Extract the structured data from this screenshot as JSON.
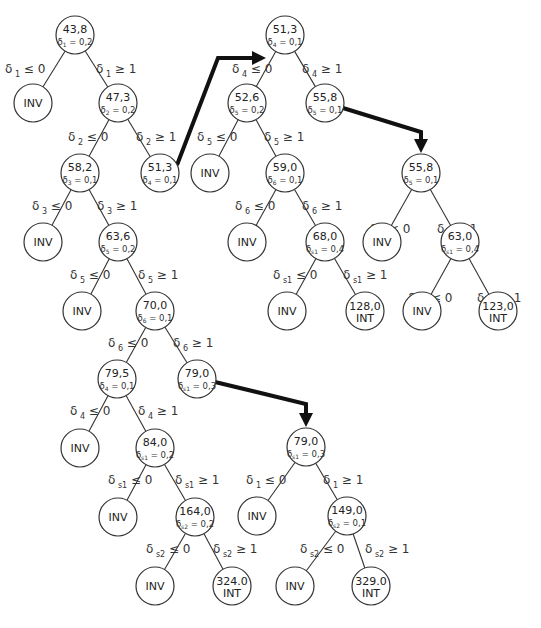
{
  "diagram": {
    "type": "branch-and-bound tree",
    "nodes": [
      {
        "id": "n1",
        "x": 75,
        "y": 35,
        "value": "43,8",
        "var": "1",
        "frac": "0,2"
      },
      {
        "id": "n2",
        "x": 33,
        "y": 103,
        "value": "INV"
      },
      {
        "id": "n3",
        "x": 118,
        "y": 103,
        "value": "47,3",
        "var": "2",
        "frac": "0,2"
      },
      {
        "id": "n4",
        "x": 80,
        "y": 173,
        "value": "58,2",
        "var": "3",
        "frac": "0,1"
      },
      {
        "id": "n5",
        "x": 160,
        "y": 173,
        "value": "51,3",
        "var": "4",
        "frac": "0,1"
      },
      {
        "id": "n6",
        "x": 43,
        "y": 242,
        "value": "INV"
      },
      {
        "id": "n7",
        "x": 118,
        "y": 242,
        "value": "63,6",
        "var": "5",
        "frac": "0,2"
      },
      {
        "id": "n8",
        "x": 82,
        "y": 311,
        "value": "INV"
      },
      {
        "id": "n9",
        "x": 155,
        "y": 311,
        "value": "70,0",
        "var": "6",
        "frac": "0,1"
      },
      {
        "id": "n10",
        "x": 117,
        "y": 379,
        "value": "79,5",
        "var": "4",
        "frac": "0,1"
      },
      {
        "id": "n11",
        "x": 197,
        "y": 379,
        "value": "79,0",
        "var": "s1",
        "frac": "0,3"
      },
      {
        "id": "n12",
        "x": 80,
        "y": 448,
        "value": "INV"
      },
      {
        "id": "n13",
        "x": 155,
        "y": 448,
        "value": "84,0",
        "var": "s1",
        "frac": "0,2"
      },
      {
        "id": "n14",
        "x": 118,
        "y": 517,
        "value": "INV"
      },
      {
        "id": "n15",
        "x": 195,
        "y": 517,
        "value": "164,0",
        "var": "s2",
        "frac": "0,2"
      },
      {
        "id": "n16",
        "x": 155,
        "y": 586,
        "value": "INV"
      },
      {
        "id": "n17",
        "x": 232,
        "y": 586,
        "value": "324.0",
        "tag": "INT"
      },
      {
        "id": "m1",
        "x": 285,
        "y": 35,
        "value": "51,3",
        "var": "4",
        "frac": "0,1"
      },
      {
        "id": "m2",
        "x": 247,
        "y": 103,
        "value": "52,6",
        "var": "5",
        "frac": "0,2"
      },
      {
        "id": "m3",
        "x": 325,
        "y": 103,
        "value": "55,8",
        "var": "5",
        "frac": "0,1"
      },
      {
        "id": "m4",
        "x": 210,
        "y": 173,
        "value": "INV"
      },
      {
        "id": "m5",
        "x": 285,
        "y": 173,
        "value": "59,0",
        "var": "6",
        "frac": "0,1"
      },
      {
        "id": "m6",
        "x": 247,
        "y": 242,
        "value": "INV"
      },
      {
        "id": "m7",
        "x": 325,
        "y": 242,
        "value": "68,0",
        "var": "s1",
        "frac": "0,4"
      },
      {
        "id": "m8",
        "x": 287,
        "y": 311,
        "value": "INV"
      },
      {
        "id": "m9",
        "x": 365,
        "y": 311,
        "value": "128,0",
        "tag": "INT"
      },
      {
        "id": "p1",
        "x": 421,
        "y": 173,
        "value": "55,8",
        "var": "5",
        "frac": "0,1"
      },
      {
        "id": "p2",
        "x": 382,
        "y": 242,
        "value": "INV"
      },
      {
        "id": "p3",
        "x": 460,
        "y": 242,
        "value": "63,0",
        "var": "s1",
        "frac": "0,4"
      },
      {
        "id": "p4",
        "x": 422,
        "y": 311,
        "value": "INV"
      },
      {
        "id": "p5",
        "x": 498,
        "y": 311,
        "value": "123,0",
        "tag": "INT"
      },
      {
        "id": "q1",
        "x": 306,
        "y": 447,
        "value": "79,0",
        "var": "s1",
        "frac": "0,3"
      },
      {
        "id": "q2",
        "x": 257,
        "y": 516,
        "value": "INV"
      },
      {
        "id": "q3",
        "x": 347,
        "y": 516,
        "value": "149,0",
        "var": "s2",
        "frac": "0,1"
      },
      {
        "id": "q4",
        "x": 295,
        "y": 586,
        "value": "INV"
      },
      {
        "id": "q5",
        "x": 371,
        "y": 586,
        "value": "329.0",
        "tag": "INT"
      }
    ],
    "edges": [
      {
        "from": "n1",
        "to": "n2",
        "label_var": "1",
        "label_op": "≤ 0",
        "lx": 5,
        "ly": 73
      },
      {
        "from": "n1",
        "to": "n3",
        "label_var": "1",
        "label_op": "≥ 1",
        "lx": 96,
        "ly": 73
      },
      {
        "from": "n3",
        "to": "n4",
        "label_var": "2",
        "label_op": "≤ 0",
        "lx": 68,
        "ly": 141
      },
      {
        "from": "n3",
        "to": "n5",
        "label_var": "2",
        "label_op": "≥ 1",
        "lx": 136,
        "ly": 141
      },
      {
        "from": "n4",
        "to": "n6",
        "label_var": "3",
        "label_op": "≤ 0",
        "lx": 32,
        "ly": 210
      },
      {
        "from": "n4",
        "to": "n7",
        "label_var": "3",
        "label_op": "≥ 1",
        "lx": 97,
        "ly": 210
      },
      {
        "from": "n7",
        "to": "n8",
        "label_var": "5",
        "label_op": "≤ 0",
        "lx": 70,
        "ly": 279
      },
      {
        "from": "n7",
        "to": "n9",
        "label_var": "5",
        "label_op": "≥ 1",
        "lx": 138,
        "ly": 279
      },
      {
        "from": "n9",
        "to": "n10",
        "label_var": "6",
        "label_op": "≤ 0",
        "lx": 108,
        "ly": 347
      },
      {
        "from": "n9",
        "to": "n11",
        "label_var": "6",
        "label_op": "≥ 1",
        "lx": 173,
        "ly": 347
      },
      {
        "from": "n10",
        "to": "n12",
        "label_var": "4",
        "label_op": "≤ 0",
        "lx": 70,
        "ly": 415
      },
      {
        "from": "n10",
        "to": "n13",
        "label_var": "4",
        "label_op": "≥ 1",
        "lx": 138,
        "ly": 415
      },
      {
        "from": "n13",
        "to": "n14",
        "label_var": "s1",
        "label_op": "≤ 0",
        "lx": 108,
        "ly": 484
      },
      {
        "from": "n13",
        "to": "n15",
        "label_var": "s1",
        "label_op": "≥ 1",
        "lx": 175,
        "ly": 484
      },
      {
        "from": "n15",
        "to": "n16",
        "label_var": "s2",
        "label_op": "≤ 0",
        "lx": 146,
        "ly": 553
      },
      {
        "from": "n15",
        "to": "n17",
        "label_var": "s2",
        "label_op": "≥ 1",
        "lx": 213,
        "ly": 553
      },
      {
        "from": "m1",
        "to": "m2",
        "label_var": "4",
        "label_op": "≤ 0",
        "lx": 232,
        "ly": 73
      },
      {
        "from": "m1",
        "to": "m3",
        "label_var": "4",
        "label_op": "≥ 1",
        "lx": 302,
        "ly": 73
      },
      {
        "from": "m2",
        "to": "m4",
        "label_var": "5",
        "label_op": "≤ 0",
        "lx": 197,
        "ly": 141
      },
      {
        "from": "m2",
        "to": "m5",
        "label_var": "5",
        "label_op": "≥ 1",
        "lx": 264,
        "ly": 141
      },
      {
        "from": "m5",
        "to": "m6",
        "label_var": "6",
        "label_op": "≤ 0",
        "lx": 235,
        "ly": 210
      },
      {
        "from": "m5",
        "to": "m7",
        "label_var": "6",
        "label_op": "≥ 1",
        "lx": 302,
        "ly": 210
      },
      {
        "from": "m7",
        "to": "m8",
        "label_var": "s1",
        "label_op": "≤ 0",
        "lx": 273,
        "ly": 279
      },
      {
        "from": "m7",
        "to": "m9",
        "label_var": "s1",
        "label_op": "≥ 1",
        "lx": 343,
        "ly": 279
      },
      {
        "from": "p1",
        "to": "p2",
        "label_var": "5",
        "label_op": "≤ 0",
        "lx": 370,
        "ly": 233
      },
      {
        "from": "p1",
        "to": "p3",
        "label_var": "5",
        "label_op": "≥ 1",
        "lx": 437,
        "ly": 233
      },
      {
        "from": "p3",
        "to": "p4",
        "label_var": "s1",
        "label_op": "≤ 0",
        "lx": 408,
        "ly": 302
      },
      {
        "from": "p3",
        "to": "p5",
        "label_var": "s1",
        "label_op": "≥ 1",
        "lx": 477,
        "ly": 302
      },
      {
        "from": "q1",
        "to": "q2",
        "label_var": "1",
        "label_op": "≤ 0",
        "lx": 246,
        "ly": 484
      },
      {
        "from": "q1",
        "to": "q3",
        "label_var": "1",
        "label_op": "≥ 1",
        "lx": 323,
        "ly": 484
      },
      {
        "from": "q3",
        "to": "q4",
        "label_var": "s2",
        "label_op": "≤ 0",
        "lx": 300,
        "ly": 553
      },
      {
        "from": "q3",
        "to": "q5",
        "label_var": "s2",
        "label_op": "≥ 1",
        "lx": 365,
        "ly": 553
      }
    ],
    "arrows": [
      {
        "name": "arrow-n5-to-m1",
        "points": "177,165 218,58 256,58",
        "head": "266,58"
      },
      {
        "name": "arrow-m3-to-p1",
        "points": "343,108 421,132 421,143",
        "head": "421,153"
      },
      {
        "name": "arrow-n11-to-q1",
        "points": "215,382 306,404 306,416",
        "head": "306,427"
      }
    ],
    "radius": 19,
    "delta_symbol": "δ"
  }
}
